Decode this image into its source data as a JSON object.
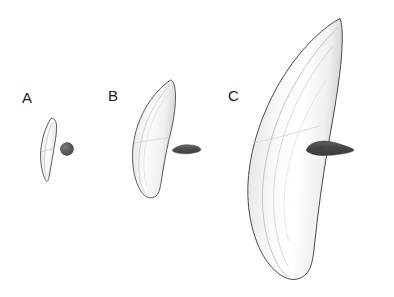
{
  "figure": {
    "type": "comparative-specimen-plate",
    "background_color": "#ffffff",
    "width": 394,
    "height": 297,
    "panels": [
      {
        "label": "A",
        "label_x": 22,
        "label_y": 90,
        "claw": {
          "name": "claw-specimen-a",
          "outline_color": "#4a4a4a",
          "fill_top": "#fdfdfd",
          "fill_bottom": "#e3e3e3",
          "bbox": [
            40,
            118,
            19,
            64
          ],
          "tip_point": [
            50,
            119
          ],
          "base_point": [
            46,
            181
          ]
        },
        "silhouette": {
          "name": "cross-section-a",
          "color": "#5c5c5c",
          "shape": "round-oval",
          "cx": 67,
          "cy": 149,
          "rx": 6.5,
          "ry": 6.5
        }
      },
      {
        "label": "B",
        "label_x": 108,
        "label_y": 88,
        "claw": {
          "name": "claw-specimen-b",
          "outline_color": "#4a4a4a",
          "fill_top": "#fdfdfd",
          "fill_bottom": "#dedede",
          "bbox": [
            132,
            78,
            44,
            121
          ],
          "tip_point": [
            170,
            80
          ],
          "base_point": [
            160,
            196
          ]
        },
        "silhouette": {
          "name": "cross-section-b",
          "color": "#4f4f4f",
          "shape": "horizontal-lens",
          "cx": 186,
          "cy": 149,
          "rx": 14,
          "ry": 4
        }
      },
      {
        "label": "C",
        "label_x": 228,
        "label_y": 88,
        "claw": {
          "name": "claw-specimen-c",
          "outline_color": "#4a4a4a",
          "fill_top": "#ffffff",
          "fill_bottom": "#dcdcdc",
          "bbox": [
            249,
            17,
            93,
            262
          ],
          "tip_point": [
            340,
            18
          ],
          "base_point": [
            330,
            277
          ]
        },
        "silhouette": {
          "name": "cross-section-c",
          "color": "#4a4a4a",
          "shape": "irregular-horizontal-blob",
          "cx": 330,
          "cy": 149,
          "rx": 25,
          "ry": 7
        }
      }
    ]
  }
}
